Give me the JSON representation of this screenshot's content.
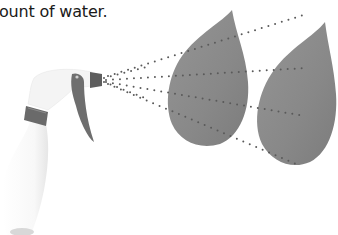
{
  "caption": {
    "text": "ount of water."
  },
  "illustration": {
    "description": "Spray bottle misting two leaves",
    "objects": [
      {
        "name": "spray-bottle",
        "label": "Spray bottle"
      },
      {
        "name": "leaf",
        "label": "Leaf 1"
      },
      {
        "name": "leaf",
        "label": "Leaf 2"
      }
    ],
    "colors": {
      "leaf": "#8c8c8c",
      "leaf_dark": "#7a7a7a",
      "spray_dots": "#5a5a5a",
      "trigger": "#6e6e6e",
      "bottle": "#f7f7f7"
    }
  }
}
